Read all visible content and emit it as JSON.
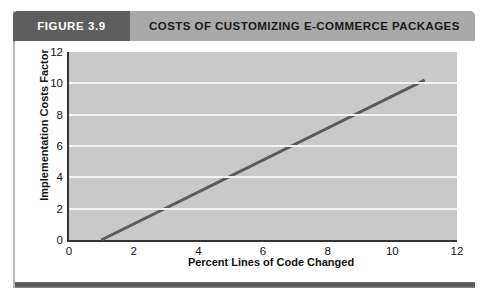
{
  "figure": {
    "tag_label": "FIGURE 3.9",
    "title": "COSTS OF CUSTOMIZING E-COMMERCE PACKAGES"
  },
  "colors": {
    "tag_background": "#5e5e5e",
    "header_background": "#a9a9a9",
    "plot_background": "#c9c9c9",
    "gridline": "#f2f2f2",
    "series_line": "#5a5a5a",
    "axis": "#333333",
    "footer_rule": "#4f4f4f"
  },
  "chart_data": {
    "type": "line",
    "title": "COSTS OF CUSTOMIZING E-COMMERCE PACKAGES",
    "xlabel": "Percent Lines of Code Changed",
    "ylabel": "Implementation Costs Factor",
    "xlim": [
      0,
      12
    ],
    "ylim": [
      0,
      12
    ],
    "xticks": [
      0,
      2,
      4,
      6,
      8,
      10,
      12
    ],
    "yticks": [
      0,
      2,
      4,
      6,
      8,
      10,
      12
    ],
    "grid": "horizontal",
    "legend": "none",
    "series": [
      {
        "name": "Implementation Costs Factor",
        "color": "#5a5a5a",
        "x": [
          1,
          11
        ],
        "values": [
          0,
          10.2
        ]
      }
    ]
  }
}
